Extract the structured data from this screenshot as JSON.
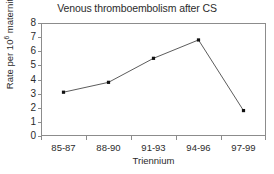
{
  "chart_data": {
    "type": "line",
    "title": "Venous thromboembolism after CS",
    "xlabel": "Triennium",
    "ylabel": "Rate per 10⁶ maternities",
    "ylabel_prefix": "Rate per 10",
    "ylabel_superscript": "6",
    "ylabel_suffix": " maternities",
    "categories": [
      "85-87",
      "88-90",
      "91-93",
      "94-96",
      "97-99"
    ],
    "values": [
      3.1,
      3.8,
      5.5,
      6.8,
      1.8
    ],
    "ylim": [
      0,
      8
    ],
    "ytick_labels": [
      "8",
      "7",
      "6",
      "5",
      "4",
      "3",
      "2",
      "1",
      "0"
    ],
    "ytick_values": [
      8,
      7,
      6,
      5,
      4,
      3,
      2,
      1,
      0
    ],
    "grid": false,
    "legend": false,
    "marker": "square",
    "line_color": "#4a4a4a",
    "marker_color": "#111111",
    "axis_color": "#8c8c8c",
    "text_color": "#2b2b2b",
    "background": "#ffffff"
  }
}
